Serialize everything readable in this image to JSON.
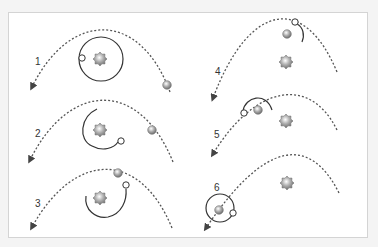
{
  "diagram": {
    "colors": {
      "background": "#f4f4f4",
      "frame": "#ffffff",
      "frame_border": "#d4d4d4",
      "trajectory": "#555555",
      "orbit": "#333333",
      "star": "#8a8a8a",
      "planet": "#9a9a9a",
      "body_fill": "#ffffff"
    },
    "panels": [
      {
        "label": "1",
        "label_pos": [
          35,
          57
        ],
        "trajectory": {
          "start": [
            170,
            92
          ],
          "ctrl1": [
            140,
            10
          ],
          "ctrl2": [
            70,
            10
          ],
          "end": [
            32,
            87
          ]
        },
        "star": [
          100,
          59
        ],
        "planet": [
          167,
          85
        ],
        "body": [
          82,
          58
        ],
        "orbit": {
          "type": "circle",
          "cx": 101,
          "cy": 59,
          "r": 22
        }
      },
      {
        "label": "2",
        "label_pos": [
          35,
          129
        ],
        "trajectory": {
          "start": [
            173,
            162
          ],
          "ctrl1": [
            140,
            80
          ],
          "ctrl2": [
            70,
            80
          ],
          "end": [
            30,
            160
          ]
        },
        "star": [
          100,
          130
        ],
        "planet": [
          152,
          130
        ],
        "body": [
          121,
          141
        ],
        "orbit": {
          "type": "arc",
          "d": "M97,109 C80,117 78,140 92,146 C103,152 114,148 118,142"
        }
      },
      {
        "label": "3",
        "label_pos": [
          35,
          199
        ],
        "trajectory": {
          "start": [
            172,
            228
          ],
          "ctrl1": [
            140,
            150
          ],
          "ctrl2": [
            75,
            150
          ],
          "end": [
            32,
            227
          ]
        },
        "star": [
          100,
          198
        ],
        "planet": [
          118,
          173
        ],
        "body": [
          126,
          185
        ],
        "orbit": {
          "type": "arc",
          "d": "M86,196 C84,210 96,219 108,217 C122,214 127,200 126,189"
        }
      },
      {
        "label": "4",
        "label_pos": [
          215,
          67
        ],
        "trajectory": {
          "start": [
            337,
            72
          ],
          "ctrl1": [
            305,
            -5
          ],
          "ctrl2": [
            250,
            0
          ],
          "end": [
            213,
            98
          ]
        },
        "star": [
          286,
          62
        ],
        "planet": [
          287,
          34
        ],
        "body": [
          295,
          22
        ],
        "orbit": {
          "type": "arc",
          "d": "M297,24 C303,27 305,35 302,42"
        }
      },
      {
        "label": "5",
        "label_pos": [
          214,
          130
        ],
        "trajectory": {
          "start": [
            337,
            130
          ],
          "ctrl1": [
            310,
            75
          ],
          "ctrl2": [
            255,
            85
          ],
          "end": [
            213,
            154
          ]
        },
        "star": [
          286,
          121
        ],
        "planet": [
          258,
          110
        ],
        "body": [
          244,
          113
        ],
        "orbit": {
          "type": "arc",
          "d": "M243,111 C245,97 266,91 272,110"
        }
      },
      {
        "label": "6",
        "label_pos": [
          214,
          183
        ],
        "trajectory": {
          "start": [
            339,
            193
          ],
          "ctrl1": [
            310,
            135
          ],
          "ctrl2": [
            265,
            140
          ],
          "end": [
            206,
            228
          ]
        },
        "star": [
          287,
          183
        ],
        "planet": [
          219,
          210
        ],
        "body": [
          233,
          213
        ],
        "orbit": {
          "type": "circle",
          "cx": 220,
          "cy": 208,
          "r": 14
        }
      }
    ]
  }
}
